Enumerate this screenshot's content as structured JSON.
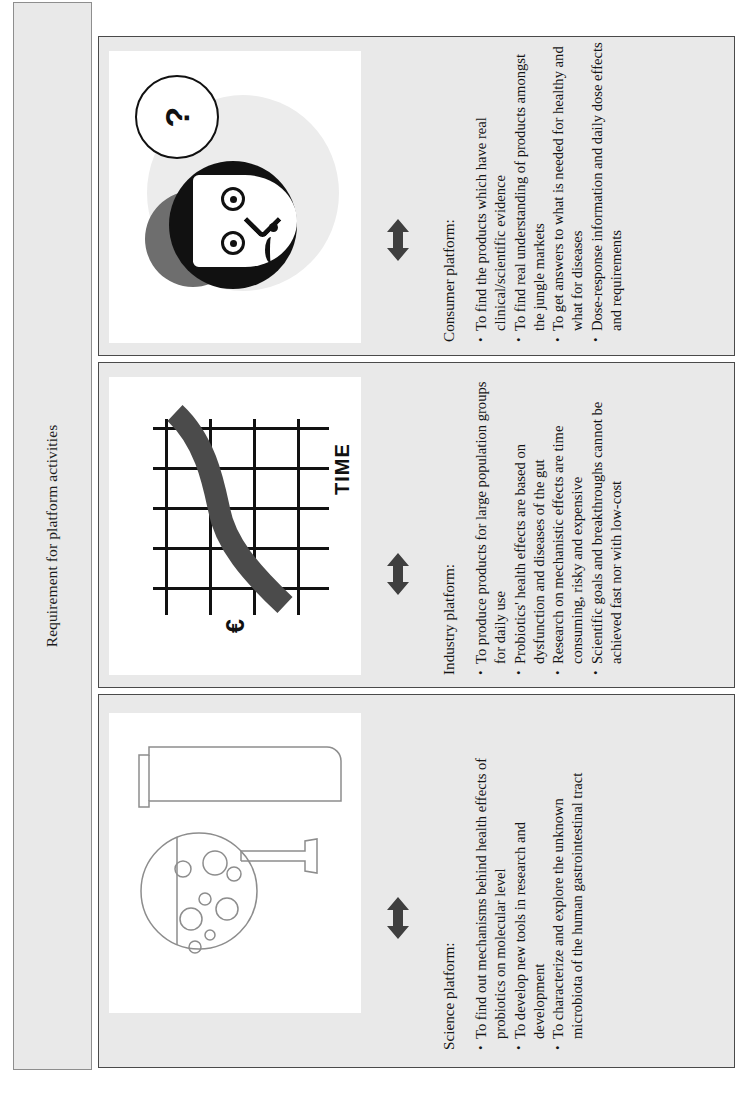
{
  "figure": {
    "title": "Requirement for platform activities",
    "accent_dark": "#111111",
    "panel_bg": "#e9e9e9",
    "panel_border": "#4a4a4a",
    "picture_bg": "#ffffff"
  },
  "panels": [
    {
      "id": "consumer",
      "heading": "Consumer platform:",
      "bullets": [
        "To find the products which have real clinical/scientific evidence",
        "To find real understanding of products amongst the jungle markets",
        "To get answers to what is needed for healthy and what for diseases",
        "Dose-response information and daily dose effects and requirements"
      ],
      "artwork": {
        "name": "confused-consumer-illustration",
        "bubble_text": "?"
      }
    },
    {
      "id": "industry",
      "heading": "Industry platform:",
      "bullets": [
        "To produce products for large population groups for daily use",
        "Probiotics' health effects are based on dysfunction and diseases of the gut",
        "Research on mechanistic effects are time consuming, risky and expensive",
        "Scientific goals and breakthroughs cannot be achieved fast nor with low-cost"
      ],
      "artwork": {
        "name": "cost-versus-time-chart-illustration",
        "x_axis_label": "TIME",
        "y_axis_label": "€"
      }
    },
    {
      "id": "science",
      "heading": "Science platform:",
      "bullets": [
        "To find out mechanisms behind health effects of probiotics on molecular level",
        "To develop new tools in research and development",
        "To characterize and explore the unknown microbiota of the human gastrointestinal tract"
      ],
      "artwork": {
        "name": "laboratory-flask-and-test-tube-illustration"
      }
    }
  ]
}
